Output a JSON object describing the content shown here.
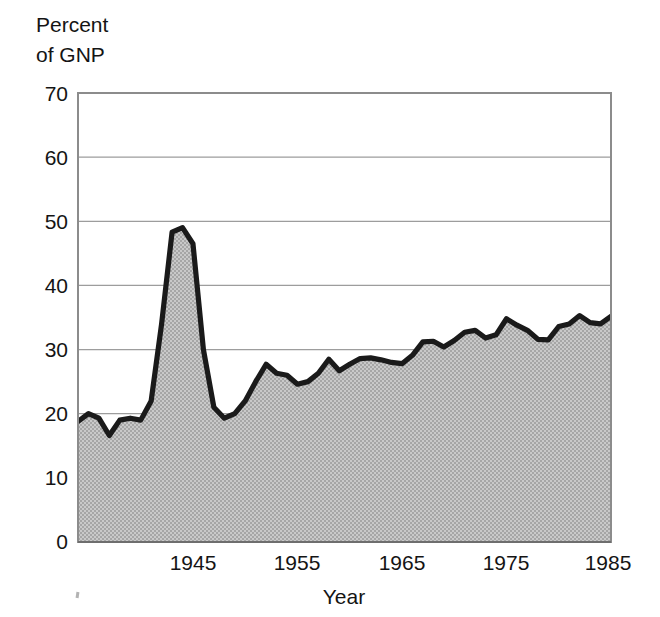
{
  "chart": {
    "ylabel_line1": "Percent",
    "ylabel_line2": "of GNP",
    "xlabel": "Year",
    "frame_color": "#8c8c8c",
    "grid_color": "#9d9d9d",
    "line_color": "#1a1a1a",
    "fill_color": "#b7b7b7"
  },
  "chart_data": {
    "type": "area",
    "title": "",
    "subtitle": "",
    "xlabel": "Year",
    "ylabel": "Percent of GNP",
    "ylim": [
      0,
      70
    ],
    "xlim": [
      1934,
      1985
    ],
    "yticks": [
      0,
      10,
      20,
      30,
      40,
      50,
      60,
      70
    ],
    "ytick_labels": [
      "0",
      "10",
      "20",
      "30",
      "40",
      "50",
      "60",
      "70"
    ],
    "xticks": [
      1945,
      1955,
      1965,
      1975,
      1985
    ],
    "xtick_labels": [
      "1945",
      "1955",
      "1965",
      "1975",
      "1985"
    ],
    "grid": true,
    "grid_axis": "y",
    "legend": null,
    "legend_position": "none",
    "series": [
      {
        "name": "Percent of GNP",
        "x": [
          1934,
          1935,
          1936,
          1937,
          1938,
          1939,
          1940,
          1941,
          1942,
          1943,
          1944,
          1945,
          1946,
          1947,
          1948,
          1949,
          1950,
          1951,
          1952,
          1953,
          1954,
          1955,
          1956,
          1957,
          1958,
          1959,
          1960,
          1961,
          1962,
          1963,
          1964,
          1965,
          1966,
          1967,
          1968,
          1969,
          1970,
          1971,
          1972,
          1973,
          1974,
          1975,
          1976,
          1977,
          1978,
          1979,
          1980,
          1981,
          1982,
          1983,
          1984,
          1985
        ],
        "values": [
          18.8,
          20.0,
          19.3,
          16.6,
          19.0,
          19.3,
          19.0,
          22.0,
          34.0,
          48.3,
          49.0,
          46.5,
          30.0,
          21.0,
          19.3,
          20.0,
          22.0,
          25.0,
          27.7,
          26.3,
          26.0,
          24.6,
          25.0,
          26.3,
          28.5,
          26.7,
          27.7,
          28.6,
          28.7,
          28.4,
          28.0,
          27.8,
          29.1,
          31.2,
          31.3,
          30.4,
          31.4,
          32.7,
          33.0,
          31.8,
          32.3,
          34.8,
          33.8,
          33.0,
          31.6,
          31.5,
          33.6,
          34.0,
          35.3,
          34.2,
          34.0,
          35.2
        ]
      }
    ]
  }
}
